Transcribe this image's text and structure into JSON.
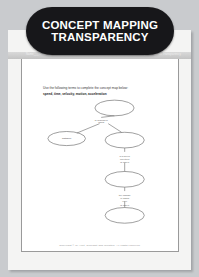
{
  "banner": {
    "title_line1": "CONCEPT MAPPING",
    "title_line2": "TRANSPARENCY",
    "background": "#17171a",
    "text_color": "#ffffff"
  },
  "subheader": {
    "left_text": "Name___ Class___",
    "right_text": "Chapter 2  Motion  Transparency"
  },
  "instructions": {
    "prompt": "Use the following terms to complete the concept map below:",
    "terms": "speed, time, velocity, motion, acceleration"
  },
  "concept_map": {
    "nodes": [
      {
        "id": "n1",
        "label": "",
        "cx": 118,
        "cy": 14,
        "rx": 25,
        "ry": 10
      },
      {
        "id": "n2",
        "label": "distance",
        "cx": 57,
        "cy": 53,
        "rx": 24,
        "ry": 9
      },
      {
        "id": "n3",
        "label": "",
        "cx": 131,
        "cy": 55,
        "rx": 25,
        "ry": 10
      },
      {
        "id": "n4",
        "label": "",
        "cx": 131,
        "cy": 105,
        "rx": 25,
        "ry": 10
      },
      {
        "id": "n5",
        "label": "",
        "cx": 131,
        "cy": 151,
        "rx": 25,
        "ry": 10
      }
    ],
    "link_labels": [
      {
        "id": "l1",
        "text": "is described\nusing",
        "x": 101,
        "y": 30
      },
      {
        "id": "l2",
        "text": "in a given\ndirection\nis called",
        "x": 131,
        "y": 76
      },
      {
        "id": "l3",
        "text": "the change\nof which\nover",
        "x": 131,
        "y": 126
      },
      {
        "id": "l4",
        "text": "is called",
        "x": 131,
        "y": 139
      }
    ],
    "stroke_color": "#6f6f6f"
  },
  "footer": {
    "credit": "Copyright © by Holt, Rinehart and Winston. All rights reserved."
  }
}
